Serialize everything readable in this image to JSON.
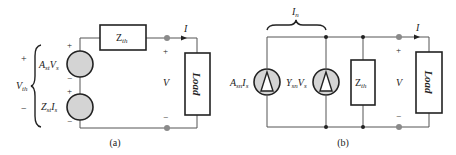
{
  "figure_a": {
    "caption": "(a)",
    "vth_label": "V",
    "vth_sub": "th",
    "vth_plus": "+",
    "vth_minus": "−",
    "source1": {
      "label_main": "A",
      "label_sub1": "st",
      "label_var": "V",
      "label_sub2": "s",
      "plus": "+",
      "minus": "−"
    },
    "source2": {
      "label_main": "Z",
      "label_sub1": "st",
      "label_var": "I",
      "label_sub2": "s",
      "plus": "+",
      "minus": "−"
    },
    "impedance": {
      "label_main": "Z",
      "label_sub": "th"
    },
    "current_label": "I",
    "voltage_label": "V",
    "voltage_plus": "+",
    "voltage_minus": "−",
    "load_label": "Load"
  },
  "figure_b": {
    "caption": "(b)",
    "norton_label": "I",
    "norton_sub": "n",
    "source1": {
      "label_main": "A",
      "label_sub1": "sn",
      "label_var": "I",
      "label_sub2": "s"
    },
    "source2": {
      "label_main": "Y",
      "label_sub1": "sn",
      "label_var": "V",
      "label_sub2": "s"
    },
    "impedance": {
      "label_main": "Z",
      "label_sub": "th"
    },
    "current_label": "I",
    "voltage_label": "V",
    "voltage_plus": "+",
    "voltage_minus": "−",
    "load_label": "Load"
  },
  "colors": {
    "wire": "#555555",
    "source_fill": "#d4d4d4",
    "terminal": "#8a8a8a",
    "box_stroke": "#222222"
  }
}
